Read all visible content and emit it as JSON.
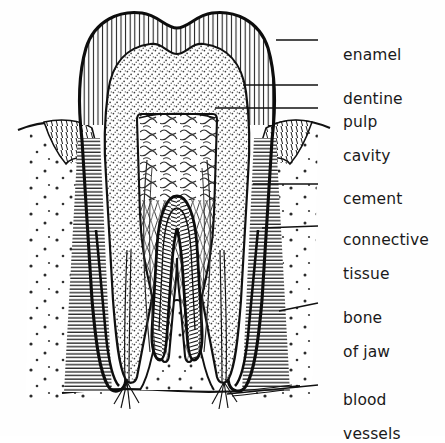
{
  "figure": {
    "style": "black-and-white line drawing with hatching",
    "background_color": "#fefefe",
    "ink_color": "#111111"
  },
  "labels": [
    {
      "id": "enamel",
      "text": "enamel",
      "text2": "",
      "x": 323,
      "y": 30,
      "leader": {
        "x1": 276,
        "y1": 40,
        "x2": 318,
        "y2": 40
      }
    },
    {
      "id": "dentine",
      "text": "dentine",
      "text2": "",
      "x": 323,
      "y": 74,
      "leader": {
        "x1": 243,
        "y1": 85,
        "x2": 318,
        "y2": 85
      }
    },
    {
      "id": "pulp-cavity",
      "text": "pulp",
      "text2": "cavity",
      "x": 323,
      "y": 97,
      "leader": {
        "x1": 215,
        "y1": 108,
        "x2": 318,
        "y2": 108
      }
    },
    {
      "id": "cement",
      "text": "cement",
      "text2": "",
      "x": 323,
      "y": 174,
      "leader": {
        "x1": 253,
        "y1": 184,
        "x2": 318,
        "y2": 184
      }
    },
    {
      "id": "connective-tissue",
      "text": "connective",
      "text2": "tissue",
      "x": 323,
      "y": 215,
      "leader": {
        "x1": 262,
        "y1": 228,
        "x2": 318,
        "y2": 226
      }
    },
    {
      "id": "bone-of-jaw",
      "text": "bone",
      "text2": "of jaw",
      "x": 323,
      "y": 293,
      "leader": {
        "x1": 279,
        "y1": 311,
        "x2": 318,
        "y2": 303
      }
    },
    {
      "id": "blood-vessels",
      "text": "blood",
      "text2": "vessels",
      "x": 323,
      "y": 375,
      "leader": {
        "x1": 227,
        "y1": 394,
        "x2": 318,
        "y2": 385
      }
    }
  ],
  "structures": [
    {
      "id": "enamel-layer",
      "name": "enamel",
      "texture": "vertical striations",
      "region": "crown outer shell"
    },
    {
      "id": "dentine-body",
      "name": "dentine",
      "texture": "fine stipple",
      "region": "crown and root core"
    },
    {
      "id": "pulp-chamber",
      "name": "pulp cavity",
      "texture": "tangled vessels",
      "region": "centre of crown"
    },
    {
      "id": "cement-layer",
      "name": "cement",
      "texture": "thin dark outline",
      "region": "root surface"
    },
    {
      "id": "connective-tissue",
      "name": "connective tissue",
      "texture": "horizontal hatching",
      "region": "around root"
    },
    {
      "id": "jaw-bone",
      "name": "bone of jaw",
      "texture": "sparse dots",
      "region": "surrounding socket"
    },
    {
      "id": "blood-vessels",
      "name": "blood vessels",
      "texture": "fine branching lines",
      "region": "root apices"
    }
  ]
}
